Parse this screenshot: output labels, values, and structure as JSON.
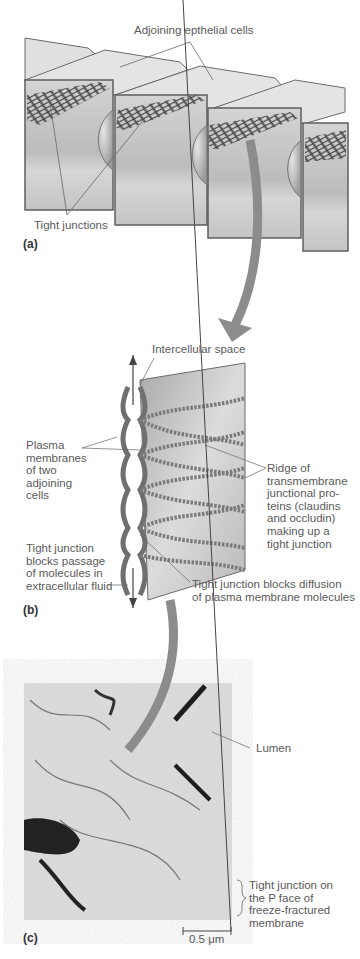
{
  "figure": {
    "panels": [
      {
        "id": "a",
        "tag": "(a)",
        "labels": {
          "top": "Adjoining epthelial cells",
          "bottom": "Tight junctions"
        }
      },
      {
        "id": "b",
        "tag": "(b)",
        "labels": {
          "intercellular": "Intercellular space",
          "plasma": "Plasma\nmembranes\nof two\nadjoining\ncells",
          "ridge": "Ridge of\ntransmembrane\njunctional pro-\nteins (claudins\nand occludin)\nmaking up a\ntight junction",
          "blocks_passage": "Tight junction\nblocks passage\nof molecules in\nextracellular fluid",
          "blocks_diffusion": "Tight junction blocks diffusion\nof plasma membrane molecules"
        }
      },
      {
        "id": "c",
        "tag": "(c)",
        "labels": {
          "lumen": "Lumen",
          "p_face": "Tight junction on\nthe P face of\nfreeze-fractured\nmembrane",
          "scale": "0.5 μm"
        }
      }
    ],
    "colors": {
      "cell_face": "#c9c9c9",
      "cell_top": "#e2e2e2",
      "edge": "#6b6b6b",
      "arrow": "#8c8c8c",
      "text": "#5a5a5a"
    }
  }
}
